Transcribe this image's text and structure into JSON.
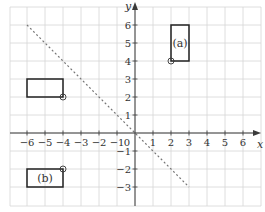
{
  "chart_data": {
    "type": "coordinate-grid",
    "title": "",
    "xlabel": "x",
    "ylabel": "y",
    "xlim": [
      -7,
      7
    ],
    "ylim": [
      -4,
      7
    ],
    "x_ticks": [
      -6,
      -5,
      -4,
      -3,
      -2,
      -1,
      0,
      1,
      2,
      3,
      4,
      5,
      6
    ],
    "y_ticks": [
      -3,
      -2,
      -1,
      1,
      2,
      3,
      4,
      5,
      6
    ],
    "grid": true,
    "shapes": [
      {
        "id": "original",
        "label": "",
        "x0": -6,
        "x1": -4,
        "y0": 2,
        "y1": 3,
        "pivot": [
          -4,
          2
        ]
      },
      {
        "id": "a",
        "label": "(a)",
        "x0": 2,
        "x1": 3,
        "y0": 4,
        "y1": 6,
        "pivot": [
          2,
          4
        ]
      },
      {
        "id": "b",
        "label": "(b)",
        "x0": -6,
        "x1": -4,
        "y0": -3,
        "y1": -2,
        "pivot": [
          -4,
          -2
        ]
      }
    ],
    "dashed_line": {
      "from": [
        -6,
        6
      ],
      "to": [
        3,
        -3
      ],
      "equation": "y = -x"
    }
  },
  "colors": {
    "grid": "#d6d6d6",
    "axis": "#3a3a3a",
    "shape_stroke": "#222222",
    "dashed_line": "#777777"
  }
}
